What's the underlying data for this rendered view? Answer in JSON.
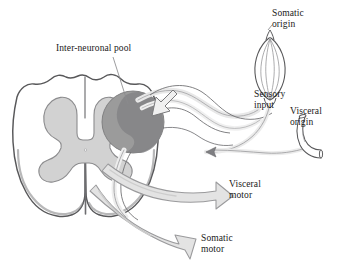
{
  "figure": {
    "background_color": "#ffffff"
  },
  "labels": {
    "interneuronal_pool": "Inter-neuronal pool",
    "somatic_origin_line1": "Somatic",
    "somatic_origin_line2": "origin",
    "sensory_input_line1": "Sensory",
    "sensory_input_line2": "input",
    "visceral_origin_line1": "Visceral",
    "visceral_origin_line2": "origin",
    "visceral_motor_line1": "Visceral",
    "visceral_motor_line2": "motor",
    "somatic_motor_line1": "Somatic",
    "somatic_motor_line2": "motor"
  },
  "structures": {
    "spinal_cord": "spinal-cord-cross-section",
    "white_matter": "white-matter",
    "gray_matter": "gray-matter-butterfly",
    "dorsal_sulcus": "dorsal-median-sulcus",
    "ventral_fissure": "ventral-median-fissure",
    "interneuronal_pool": "inter-neuronal-pool-circle",
    "muscle_spindle": "muscle-spindle-somatic-receptor",
    "visceral_tube": "visceral-organ-tube",
    "sensory_fiber": "sensory-afferent-fiber",
    "visceral_motor_arrow": "visceral-motor-efferent-arrow",
    "somatic_motor_arrow": "somatic-motor-efferent-arrow",
    "incoming_arrow": "sensory-input-arrowhead"
  },
  "colors": {
    "outline": "#58585a",
    "outline_dark": "#404042",
    "gray_matter_fill": "#d2d2d2",
    "gray_matter_stroke": "#8c8c8e",
    "pool_fill": "#9b9b9b",
    "pool_inner_fill": "#848486",
    "pool_stroke": "#7a7a7c",
    "arrow_fill": "#e3e3e3",
    "arrow_stroke": "#9a9a9c",
    "fiber_fill": "#e8e8e8",
    "fiber_stroke": "#9e9ea0",
    "label_color": "#1a1a1a",
    "leader_line": "#8a8a8c",
    "white_matter_fill": "#ffffff"
  }
}
